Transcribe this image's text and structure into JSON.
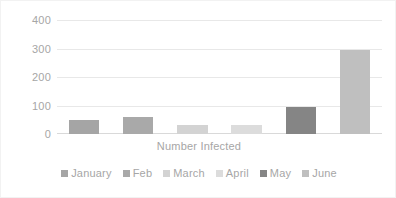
{
  "chart_data": {
    "type": "bar",
    "title": "",
    "xlabel": "Number Infected",
    "ylabel": "",
    "categories": [
      "January",
      "Feb",
      "March",
      "April",
      "May",
      "June"
    ],
    "values": [
      50,
      60,
      30,
      32,
      95,
      295
    ],
    "ylim": [
      0,
      400
    ],
    "yticks": [
      0,
      100,
      200,
      300,
      400
    ],
    "ytick_labels": [
      "0",
      "100",
      "200",
      "300",
      "400"
    ],
    "grid": true,
    "legend_position": "bottom",
    "legend_entries": [
      "January",
      "Feb",
      "March",
      "April",
      "May",
      "June"
    ],
    "colors": [
      "#a5a5a5",
      "#a9a9a9",
      "#d3d3d3",
      "#dcdcdc",
      "#858585",
      "#bfbfbf"
    ],
    "axis_label_color": "#a6a6a6",
    "gridline_color": "#e8e8e8",
    "background": "#ffffff"
  }
}
